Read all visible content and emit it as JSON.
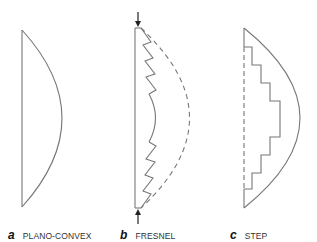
{
  "colors": {
    "line": "#777777",
    "text": "#333333",
    "background": "#ffffff"
  },
  "lenses": [
    {
      "letter": "a",
      "name": "PLANO-CONVEX"
    },
    {
      "letter": "b",
      "name": "FRESNEL"
    },
    {
      "letter": "c",
      "name": "STEP"
    }
  ]
}
